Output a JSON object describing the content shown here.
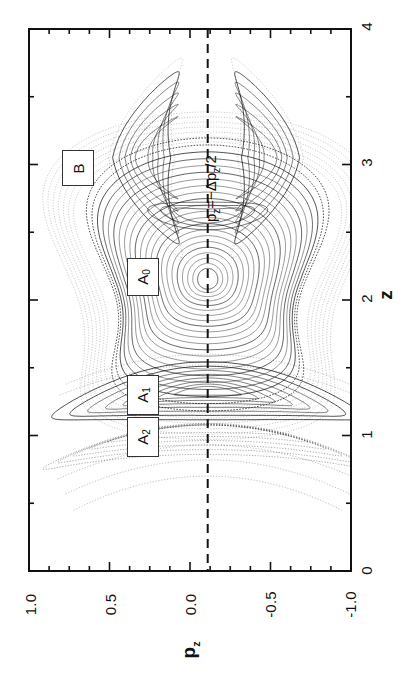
{
  "figure": {
    "kind": "poincare-surface-of-section",
    "background": "#ffffff",
    "ink": "#111111",
    "orientation_note": "rotated-90-ccw"
  },
  "axes": {
    "horizontal": {
      "name": "p_z",
      "label_html": "p<sub>z</sub>",
      "ticks": [
        "1.0",
        "0.5",
        "0.0",
        "-0.5",
        "-1.0"
      ],
      "tick_values": [
        1.0,
        0.5,
        0.0,
        -0.5,
        -1.0
      ],
      "range": [
        1.0,
        -1.0
      ],
      "minor_per_interval": 4
    },
    "vertical": {
      "name": "z",
      "label_html": "z",
      "ticks": [
        "0",
        "1",
        "2",
        "3",
        "4"
      ],
      "tick_values": [
        0,
        1,
        2,
        3,
        4
      ],
      "range": [
        0,
        4
      ],
      "minor_per_interval": 2
    }
  },
  "annotations": {
    "dashed_line": {
      "label_plain": "p_z=-Δp_z/2",
      "label_prefix": "p",
      "label_sub1": "z",
      "label_mid": "=−Δp",
      "label_sub2": "z",
      "label_suffix": "/2",
      "p_z_value": -0.11,
      "style": "dashed",
      "color": "#111111"
    },
    "islands": [
      {
        "id": "B",
        "label": "B",
        "sub": "",
        "z": 3.05,
        "p_z": 0.46
      },
      {
        "id": "A0",
        "label": "A",
        "sub": "0",
        "z": 2.18,
        "p_z": 0.12
      },
      {
        "id": "A1",
        "label": "A",
        "sub": "1",
        "z": 1.33,
        "p_z": 0.14
      },
      {
        "id": "A2",
        "label": "A",
        "sub": "2",
        "z": 1.07,
        "p_z": 0.14
      }
    ]
  },
  "chart_data": {
    "type": "scatter",
    "title": "",
    "xlabel": "p_z",
    "ylabel": "z",
    "xlim": [
      1.0,
      -1.0
    ],
    "ylim": [
      0,
      4
    ],
    "grid": false,
    "legend": "none",
    "structures": [
      {
        "name": "A0",
        "kind": "nested-triangular-tori",
        "center": {
          "z": 2.15,
          "p_z": -0.11
        },
        "z_extent": [
          1.45,
          2.85
        ],
        "p_z_extent": [
          -0.62,
          0.52
        ],
        "ring_count": 22
      },
      {
        "name": "A1",
        "kind": "nested-lens-tori",
        "center": {
          "z": 1.33,
          "p_z": -0.11
        },
        "z_extent": [
          1.12,
          1.45
        ],
        "p_z_extent": [
          -0.6,
          0.56
        ],
        "ring_count": 8
      },
      {
        "name": "A2",
        "kind": "chaotic-band",
        "center": {
          "z": 1.05,
          "p_z": -0.11
        },
        "z_extent": [
          0.78,
          1.15
        ],
        "p_z_extent": [
          -0.58,
          0.56
        ],
        "ring_count": 6
      },
      {
        "name": "B-upper",
        "kind": "crescent-island",
        "center": {
          "z": 3.05,
          "p_z": 0.3
        },
        "z_extent": [
          2.45,
          3.72
        ],
        "p_z_extent": [
          0.05,
          0.52
        ],
        "ring_count": 5
      },
      {
        "name": "B-lower",
        "kind": "crescent-island",
        "center": {
          "z": 3.05,
          "p_z": -0.5
        },
        "z_extent": [
          2.45,
          3.72
        ],
        "p_z_extent": [
          -0.72,
          -0.26
        ],
        "ring_count": 5
      },
      {
        "name": "outer-arcs",
        "kind": "thin-arcs",
        "z_extent": [
          0.62,
          0.95
        ],
        "p_z_extent": [
          -0.58,
          0.55
        ],
        "ring_count": 3
      }
    ]
  }
}
